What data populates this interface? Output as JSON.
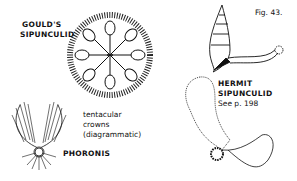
{
  "figure": {
    "number_label": "Fig. 43.",
    "labels": {
      "goulds_line1": "GOULD'S",
      "goulds_line2": "SIPUNCULID",
      "hermit_line1": "HERMIT",
      "hermit_line2": "SIPUNCULID",
      "hermit_ref": "See p. 198",
      "crowns_line1": "tentacular",
      "crowns_line2": "crowns",
      "crowns_line3": "(diagrammatic)",
      "phoronis": "PHORONIS"
    },
    "ink_color": "#111111",
    "background": "#ffffff"
  }
}
